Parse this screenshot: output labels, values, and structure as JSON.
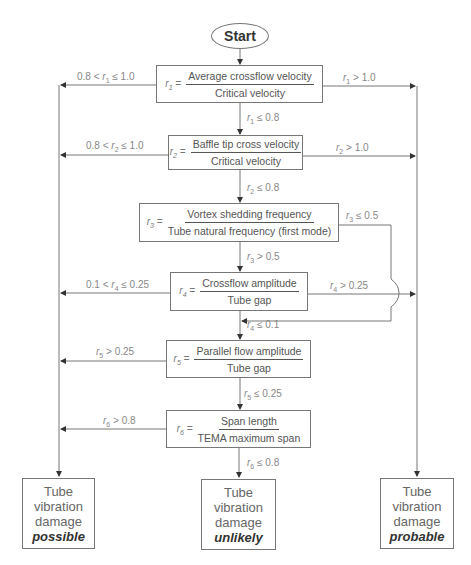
{
  "start": {
    "label": "Start"
  },
  "decisions": [
    {
      "var": "r",
      "sub": "1",
      "eq": "=",
      "numerator": "Average  crossflow velocity",
      "denominator": "Critical velocity"
    },
    {
      "var": "r",
      "sub": "2",
      "eq": "=",
      "numerator": "Baffle tip cross velocity",
      "denominator": "Critical velocity"
    },
    {
      "var": "r",
      "sub": "3",
      "eq": "=",
      "numerator": "Vortex shedding frequency",
      "denominator": "Tube natural frequency (first mode)"
    },
    {
      "var": "r",
      "sub": "4",
      "eq": "=",
      "numerator": "Crossflow amplitude",
      "denominator": "Tube gap"
    },
    {
      "var": "r",
      "sub": "5",
      "eq": "=",
      "numerator": "Parallel flow amplitude",
      "denominator": "Tube gap"
    },
    {
      "var": "r",
      "sub": "6",
      "eq": "=",
      "numerator": "Span length",
      "denominator": "TEMA maximum span"
    }
  ],
  "edges": {
    "r1_left": {
      "pre": "0.8 < ",
      "var": "r",
      "sub": "1",
      "post": " ≤ 1.0"
    },
    "r1_right": {
      "pre": "",
      "var": "r",
      "sub": "1",
      "post": " > 1.0"
    },
    "r1_down": {
      "pre": "",
      "var": "r",
      "sub": "1",
      "post": " ≤ 0.8"
    },
    "r2_left": {
      "pre": "0.8 < ",
      "var": "r",
      "sub": "2",
      "post": " ≤ 1.0"
    },
    "r2_right": {
      "pre": "",
      "var": "r",
      "sub": "2",
      "post": " > 1.0"
    },
    "r2_down": {
      "pre": "",
      "var": "r",
      "sub": "2",
      "post": " ≤ 0.8"
    },
    "r3_right": {
      "pre": "",
      "var": "r",
      "sub": "3",
      "post": " ≤ 0.5"
    },
    "r3_down": {
      "pre": "",
      "var": "r",
      "sub": "3",
      "post": " > 0.5"
    },
    "r4_left": {
      "pre": "0.1 < ",
      "var": "r",
      "sub": "4",
      "post": " ≤ 0.25"
    },
    "r4_right": {
      "pre": "",
      "var": "r",
      "sub": "4",
      "post": " > 0.25"
    },
    "r4_down": {
      "pre": "",
      "var": "r",
      "sub": "4",
      "post": " ≤ 0.1"
    },
    "r5_left": {
      "pre": "",
      "var": "r",
      "sub": "5",
      "post": " > 0.25"
    },
    "r5_down": {
      "pre": "",
      "var": "r",
      "sub": "5",
      "post": " ≤ 0.25"
    },
    "r6_left": {
      "pre": "",
      "var": "r",
      "sub": "6",
      "post": " > 0.8"
    },
    "r6_down": {
      "pre": "",
      "var": "r",
      "sub": "6",
      "post": " ≤ 0.8"
    }
  },
  "outcomes": {
    "left": {
      "line1": "Tube",
      "line2": "vibration",
      "line3": "damage",
      "verdict": "possible"
    },
    "middle": {
      "line1": "Tube",
      "line2": "vibration",
      "line3": "damage",
      "verdict": "unlikely"
    },
    "right": {
      "line1": "Tube",
      "line2": "vibration",
      "line3": "damage",
      "verdict": "probable"
    }
  }
}
